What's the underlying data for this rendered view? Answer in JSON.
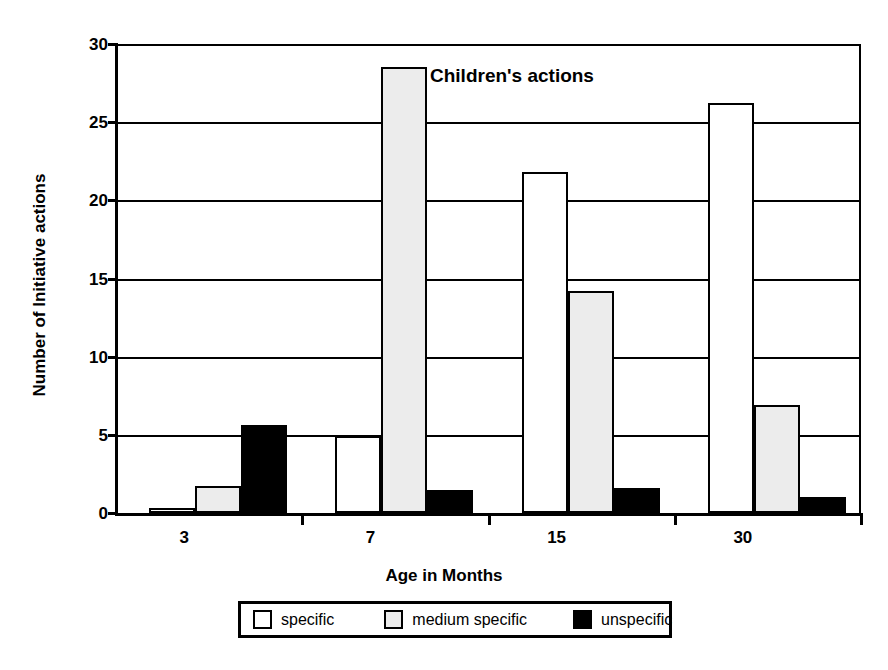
{
  "chart_data": {
    "type": "bar",
    "title": "Children's actions",
    "xlabel": "Age in Months",
    "ylabel": "Number of Initiative actions",
    "categories": [
      "3",
      "7",
      "15",
      "30"
    ],
    "series": [
      {
        "name": "specific",
        "color": "#ffffff",
        "values": [
          0.3,
          4.9,
          21.8,
          26.2
        ]
      },
      {
        "name": "medium specific",
        "color": "#ececec",
        "values": [
          1.7,
          28.5,
          14.2,
          6.9
        ]
      },
      {
        "name": "unspecific",
        "color": "#000000",
        "values": [
          5.6,
          1.5,
          1.6,
          1.0
        ]
      }
    ],
    "ylim": [
      0,
      30
    ],
    "yticks": [
      0,
      5,
      10,
      15,
      20,
      25,
      30
    ],
    "ytick_labels": [
      "0",
      "5",
      "10",
      "15",
      "20",
      "25",
      "30"
    ],
    "grid": "horizontal",
    "legend_position": "bottom-center"
  },
  "legend": {
    "entries": [
      {
        "label": "specific"
      },
      {
        "label": "medium specific"
      },
      {
        "label": "unspecific"
      }
    ]
  }
}
